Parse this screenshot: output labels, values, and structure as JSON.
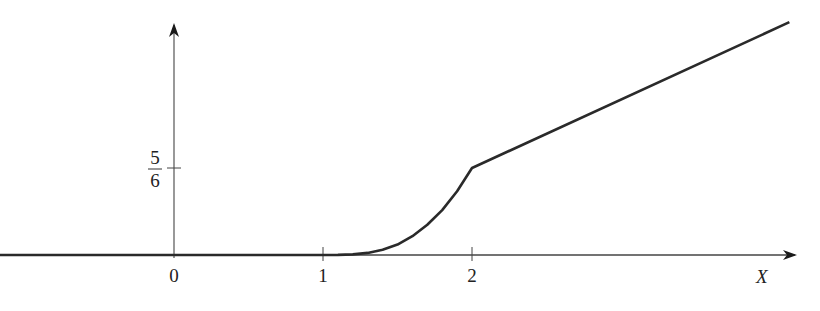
{
  "chart_data": {
    "type": "line",
    "title": "",
    "xlabel": "X",
    "ylabel": "",
    "xlim": [
      -1.17,
      4.2
    ],
    "ylim": [
      0,
      2.3
    ],
    "grid": false,
    "legend": "none",
    "x_ticks": [
      {
        "value": 0,
        "label": "0"
      },
      {
        "value": 1,
        "label": "1"
      },
      {
        "value": 2,
        "label": "2"
      }
    ],
    "y_ticks": [
      {
        "value": 0.8333,
        "numerator": "5",
        "denominator": "6"
      }
    ],
    "series": [
      {
        "name": "curve",
        "color": "#2a2a2a",
        "points": [
          [
            -1.17,
            0
          ],
          [
            1.0,
            0
          ],
          [
            1.1,
            0.001
          ],
          [
            1.2,
            0.006
          ],
          [
            1.3,
            0.02
          ],
          [
            1.4,
            0.05
          ],
          [
            1.5,
            0.1
          ],
          [
            1.6,
            0.18
          ],
          [
            1.7,
            0.29
          ],
          [
            1.8,
            0.43
          ],
          [
            1.9,
            0.61
          ],
          [
            2.0,
            0.8333
          ],
          [
            4.13,
            2.23
          ]
        ]
      }
    ]
  }
}
